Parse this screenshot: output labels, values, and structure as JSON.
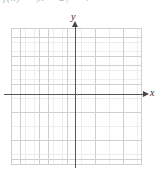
{
  "figure": {
    "type": "coordinate-grid",
    "background_color": "#ffffff",
    "width": 160,
    "height": 172
  },
  "formula": {
    "clipped": true,
    "text": "f(x) = |x − 2| − 4",
    "function_name": "f",
    "variable": "x",
    "color": "#b9b9b9"
  },
  "axes": {
    "x_label": "x",
    "y_label": "y",
    "axis_color": "#555555",
    "arrow_color": "#444444",
    "x_arrow_icon": "arrow-right-icon",
    "y_arrow_icon": "arrow-up-icon"
  },
  "grid": {
    "major_color": "#cfcfcf",
    "minor_color": "#ededed",
    "major_spacing_px": 9.36,
    "minor_spacing_px": 4.68,
    "major_columns": 14,
    "major_rows": 14,
    "origin_x_px": 76,
    "origin_y_px": 95,
    "tick_labels": [],
    "plotted_points": []
  },
  "chart_data": {
    "type": "scatter",
    "title": "",
    "subtitle": "",
    "xlabel": "x",
    "ylabel": "y",
    "xlim": [
      -7,
      7
    ],
    "ylim": [
      -7,
      7
    ],
    "xticks": [],
    "yticks": [],
    "grid": true,
    "legend": false,
    "series": [
      {
        "name": "",
        "x": [],
        "y": []
      }
    ],
    "annotations": [],
    "note": "Empty labeled coordinate plane; no data plotted."
  }
}
